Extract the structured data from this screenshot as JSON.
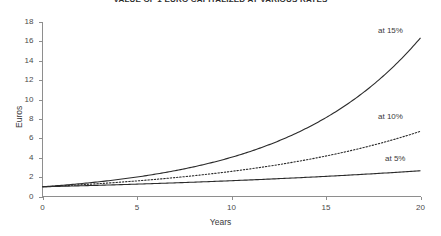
{
  "chart_data": {
    "type": "line",
    "title": "VALUE OF 1 EURO CAPITALIZED AT VARIOUS RATES",
    "xlabel": "Years",
    "ylabel": "Euros",
    "xlim": [
      0,
      20
    ],
    "ylim": [
      0,
      18
    ],
    "xticks": [
      "0",
      "5",
      "10",
      "15",
      "20"
    ],
    "xtick_values": [
      0,
      5,
      10,
      15,
      20
    ],
    "yticks": [
      "0",
      "2",
      "4",
      "6",
      "8",
      "10",
      "12",
      "14",
      "16",
      "18"
    ],
    "ytick_values": [
      0,
      2,
      4,
      6,
      8,
      10,
      12,
      14,
      16,
      18
    ],
    "grid": false,
    "legend_position": "inline-right",
    "x": [
      0,
      1,
      2,
      3,
      4,
      5,
      6,
      7,
      8,
      9,
      10,
      11,
      12,
      13,
      14,
      15,
      16,
      17,
      18,
      19,
      20
    ],
    "series": [
      {
        "name": "at 15%",
        "rate": 0.15,
        "style": "solid",
        "label": "at 15%",
        "values": [
          1.0,
          1.15,
          1.32,
          1.52,
          1.75,
          2.01,
          2.31,
          2.66,
          3.06,
          3.52,
          4.05,
          4.65,
          5.35,
          6.15,
          7.08,
          8.14,
          9.36,
          10.76,
          12.38,
          14.23,
          16.37
        ]
      },
      {
        "name": "at 10%",
        "rate": 0.1,
        "style": "dotted",
        "label": "at 10%",
        "values": [
          1.0,
          1.1,
          1.21,
          1.33,
          1.46,
          1.61,
          1.77,
          1.95,
          2.14,
          2.36,
          2.59,
          2.85,
          3.14,
          3.45,
          3.8,
          4.18,
          4.59,
          5.05,
          5.56,
          6.12,
          6.73
        ]
      },
      {
        "name": "at 5%",
        "rate": 0.05,
        "style": "solid",
        "label": "at 5%",
        "values": [
          1.0,
          1.05,
          1.1,
          1.16,
          1.22,
          1.28,
          1.34,
          1.41,
          1.48,
          1.55,
          1.63,
          1.71,
          1.8,
          1.89,
          1.98,
          2.08,
          2.18,
          2.29,
          2.41,
          2.53,
          2.65
        ]
      }
    ],
    "annotations": [
      {
        "text": "at 15%",
        "x_px": 378,
        "y_px": 26
      },
      {
        "text": "at 10%",
        "x_px": 378,
        "y_px": 112
      },
      {
        "text": "at 5%",
        "x_px": 385,
        "y_px": 154
      }
    ]
  },
  "colors": {
    "curve": "#2b2b2b",
    "axis": "#8e8e8e",
    "text": "#3a3a3a",
    "background": "#ffffff"
  }
}
